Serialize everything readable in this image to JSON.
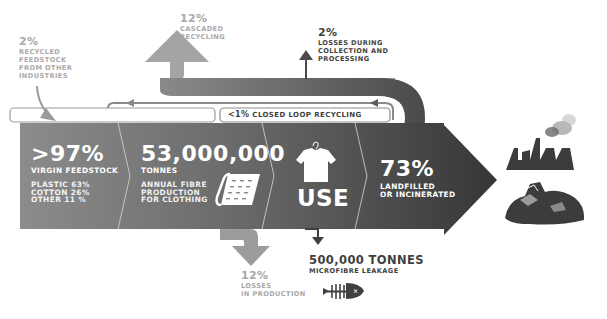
{
  "colors": {
    "band_left": "#8a8a8a",
    "band_right": "#3c3c3c",
    "cascade_arrow": "#a6a6a6",
    "loss_arrow": "#9c9c9c",
    "loop_line": "#8c8c8c",
    "text_light": "#a8a8a8",
    "text_dark": "#3f3f3f"
  },
  "recycled_feedstock": {
    "percent": "2%",
    "lines": [
      "RECYCLED",
      "FEEDSTOCK",
      "FROM OTHER",
      "INDUSTRIES"
    ]
  },
  "cascaded": {
    "percent": "12%",
    "lines": [
      "CASCADED",
      "RECYCLING"
    ]
  },
  "collection_losses": {
    "percent": "2%",
    "lines": [
      "LOSSES DURING",
      "COLLECTION AND",
      "PROCESSING"
    ]
  },
  "closed_loop": {
    "percent": "<1%",
    "label": "CLOSED LOOP RECYCLING"
  },
  "virgin": {
    "percent": ">97%",
    "label": "VIRGIN FEEDSTOCK",
    "breakdown": [
      "PLASTIC 63%",
      "COTTON 26%",
      "OTHER 11 %"
    ]
  },
  "production": {
    "value": "53,000,000",
    "unit": "TONNES",
    "lines": [
      "ANNUAL FIBRE",
      "PRODUCTION",
      "FOR CLOTHING"
    ],
    "icon": "fabric-roll-icon"
  },
  "use": {
    "label": "USE",
    "icon": "tshirt-hanger-icon"
  },
  "landfill": {
    "percent": "73%",
    "lines": [
      "LANDFILLED",
      "OR INCINERATED"
    ],
    "icons": [
      "factory-smoke-icon",
      "landfill-heap-icon"
    ]
  },
  "production_losses": {
    "percent": "12%",
    "lines": [
      "LOSSES",
      "IN PRODUCTION"
    ]
  },
  "microfibre": {
    "value": "500,000 TONNES",
    "label": "MICROFIBRE LEAKAGE",
    "icon": "fish-skeleton-icon"
  }
}
